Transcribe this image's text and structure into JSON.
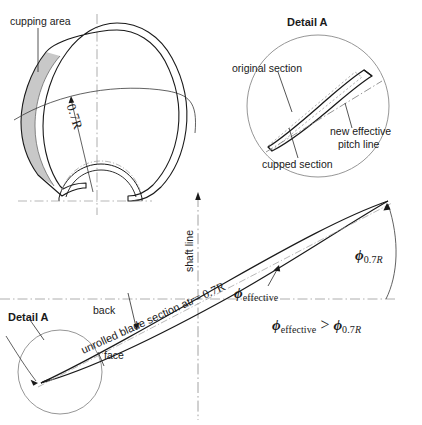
{
  "figure": {
    "background_color": "#ffffff",
    "line_color": "#1a1a1a",
    "thin_line_color": "#555555",
    "shade_color": "#c8c8c8",
    "width": 422,
    "height": 425
  },
  "blade_plan": {
    "cupping_label": "cupping area",
    "radius_label": "0.7R"
  },
  "detail_a_top": {
    "title": "Detail A",
    "original_section_label": "original section",
    "cupped_section_label": "cupped section",
    "new_pitch_line_label": "new effective\npitch line",
    "new_pitch_line_1": "new effective",
    "new_pitch_line_2": "pitch line"
  },
  "detail_a_bottom": {
    "title": "Detail A"
  },
  "section_view": {
    "shaft_line_label": "shaft line",
    "blade_section_label_prefix": "unrolled blade section at",
    "blade_section_label_r": "r",
    "blade_section_label_eq": "= 0.7R",
    "back_label": "back",
    "face_label": "face"
  },
  "angles": {
    "phi_symbol": "ϕ",
    "phi_effective_sub": "effective",
    "phi_07r_sub_num": "0.7",
    "phi_07r_sub_r": "R",
    "inequality_operator": ">"
  }
}
